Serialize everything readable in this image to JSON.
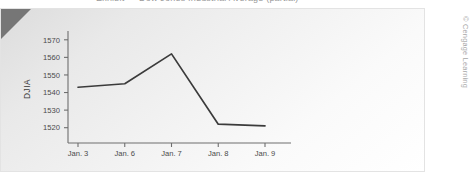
{
  "top_partial_text": "Exhibit — Dow Jones Industrial Average (partial)",
  "credit": "© Cengage Learning",
  "axis": {
    "ylabel": "DJIA",
    "yticks": [
      "1570",
      "1560",
      "1550",
      "1540",
      "1530",
      "1520"
    ],
    "xticks": [
      "Jan. 3",
      "Jan. 6",
      "Jan. 7",
      "Jan. 8",
      "Jan. 9"
    ]
  },
  "colors": {
    "line": "#3b3b3b",
    "axis": "#6e6e6e",
    "tick_text": "#4a4a4a",
    "panel_light": "#ffffff",
    "panel_dark": "#dcdcdc",
    "corner_wedge": "#767676",
    "credit_text": "#a7a7a7"
  },
  "chart_data": {
    "type": "line",
    "title": "",
    "xlabel": "",
    "ylabel": "DJIA",
    "categories": [
      "Jan. 3",
      "Jan. 6",
      "Jan. 7",
      "Jan. 8",
      "Jan. 9"
    ],
    "values": [
      1543,
      1545,
      1562,
      1522,
      1521
    ],
    "ylim": [
      1513,
      1575
    ],
    "yticks": [
      1520,
      1530,
      1540,
      1550,
      1560,
      1570
    ],
    "grid": false,
    "legend": false
  }
}
